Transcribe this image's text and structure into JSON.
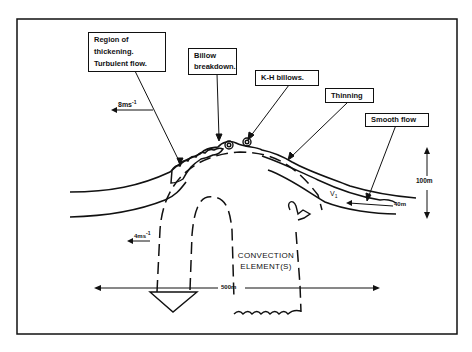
{
  "diagram": {
    "type": "schematic cross-section",
    "labels": {
      "region_thickening": [
        "Region of",
        "thickening.",
        "Turbulent flow."
      ],
      "billow_breakdown": [
        "Billow",
        "breakdown."
      ],
      "kh_billows": "K-H billows.",
      "thinning": "Thinning",
      "smooth_flow": "Smooth flow",
      "convection": [
        "CONVECTION",
        "ELEMENT(S)"
      ]
    },
    "measurements": {
      "upper_speed": "8ms",
      "upper_speed_exp": "-1",
      "lower_speed": "4ms",
      "lower_speed_exp": "-1",
      "height_scale": "100m",
      "layer_thickness": "40m",
      "width_scale": "500m",
      "velocity_symbol": "V",
      "velocity_subscript": "1"
    },
    "colors": {
      "ink": "#111111",
      "background": "#ffffff"
    }
  }
}
